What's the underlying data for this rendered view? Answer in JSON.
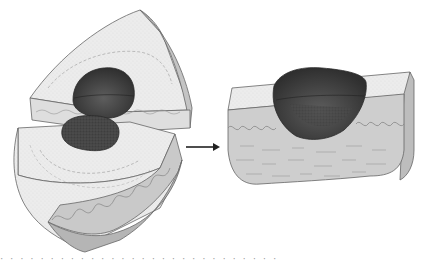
{
  "figure": {
    "left_panel": {
      "label": "split-blocks",
      "parts": [
        "upper-wedge",
        "lower-wedge"
      ],
      "inclusion": "dark-ovoid"
    },
    "arrow": {
      "direction": "right"
    },
    "right_panel": {
      "label": "assembled-block",
      "inclusion": "dark-hemisphere"
    },
    "bottom_text_fragment": "· · · · · · · · · · · · · · · · · · · · · · · · · · · ·"
  },
  "colors": {
    "background": "#ffffff",
    "surface_light": "#ebebeb",
    "surface_mid": "#c9c9c9",
    "surface_side": "#b3b3b3",
    "inclusion_dark": "#3a3a3a",
    "inclusion_mid": "#5a5a5a",
    "outline": "#555555",
    "arrow": "#222222"
  }
}
